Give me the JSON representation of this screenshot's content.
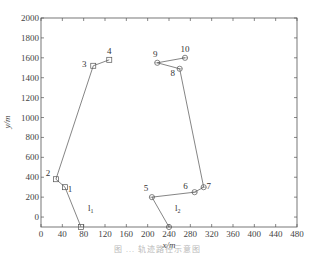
{
  "chart_data": {
    "type": "line",
    "title": "",
    "xlabel": "x/m",
    "ylabel": "y/m",
    "xlim": [
      0,
      480
    ],
    "ylim": [
      -100,
      2000
    ],
    "xticks": [
      0,
      40,
      80,
      120,
      160,
      200,
      240,
      280,
      320,
      360,
      400,
      440,
      480
    ],
    "yticks": [
      0,
      200,
      400,
      600,
      800,
      1000,
      1200,
      1400,
      1600,
      1800,
      2000
    ],
    "grid": false,
    "series": [
      {
        "name": "l1",
        "label": "l",
        "subscript": "1",
        "marker": "square",
        "points": [
          {
            "x": 75,
            "y": -100,
            "label": ""
          },
          {
            "x": 45,
            "y": 300,
            "label": "1"
          },
          {
            "x": 28,
            "y": 380,
            "label": "2"
          },
          {
            "x": 98,
            "y": 1520,
            "label": "3"
          },
          {
            "x": 128,
            "y": 1580,
            "label": "4"
          }
        ]
      },
      {
        "name": "l2",
        "label": "l",
        "subscript": "2",
        "marker": "circle",
        "points": [
          {
            "x": 240,
            "y": -100,
            "label": ""
          },
          {
            "x": 208,
            "y": 200,
            "label": "5"
          },
          {
            "x": 288,
            "y": 250,
            "label": "6"
          },
          {
            "x": 305,
            "y": 300,
            "label": "7"
          },
          {
            "x": 260,
            "y": 1490,
            "label": "8"
          },
          {
            "x": 218,
            "y": 1550,
            "label": "9"
          },
          {
            "x": 270,
            "y": 1600,
            "label": "10"
          }
        ]
      }
    ]
  },
  "caption": "图 ... 轨迹路径示意图"
}
